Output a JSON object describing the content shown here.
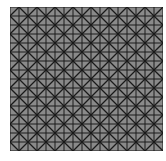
{
  "pattern": {
    "cols": 17,
    "rows": 16,
    "cell_size": 9,
    "fill_color": "#8a8a8a",
    "line_color": "#1a1a1a",
    "background": "#ffffff"
  }
}
